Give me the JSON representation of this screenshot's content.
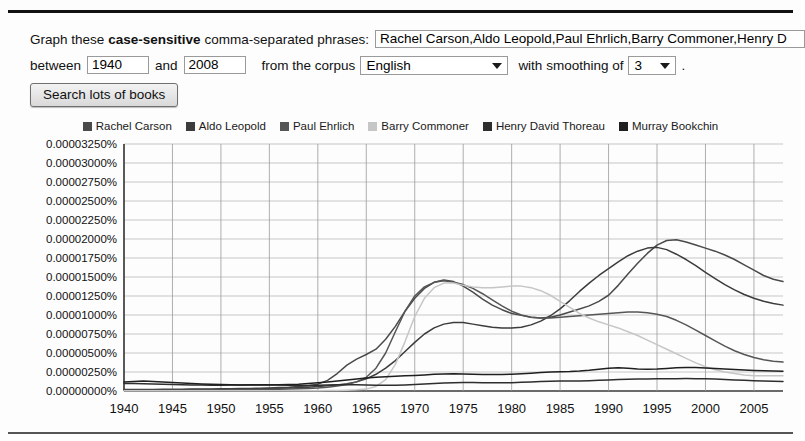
{
  "form": {
    "label_prefix": "Graph these",
    "label_emphasis": "case-sensitive",
    "label_suffix": "comma-separated phrases:",
    "phrases_value": "Rachel Carson,Aldo Leopold,Paul Ehrlich,Barry Commoner,Henry D",
    "phrases_placeholder": "comma-separated phrases",
    "between_label": "between",
    "start_year": "1940",
    "and_label": "and",
    "end_year": "2008",
    "corpus_label": "from the corpus",
    "corpus_value": "English",
    "corpus_options": [
      "English"
    ],
    "smoothing_label": "with smoothing of",
    "smoothing_value": "3",
    "smoothing_options": [
      "3"
    ],
    "trailing_period": ".",
    "search_button": "Search lots of books"
  },
  "chart_data": {
    "type": "line",
    "title": "",
    "xlabel": "",
    "ylabel": "",
    "xlim": [
      1940,
      2008
    ],
    "ylim": [
      0.0,
      3.25e-05
    ],
    "grid": true,
    "legend_position": "top",
    "x_ticks": [
      1940,
      1945,
      1950,
      1955,
      1960,
      1965,
      1970,
      1975,
      1980,
      1985,
      1990,
      1995,
      2000,
      2005
    ],
    "y_ticks": [
      0.0,
      2.5e-06,
      5e-06,
      7.5e-06,
      1e-05,
      1.25e-05,
      1.5e-05,
      1.75e-05,
      2e-05,
      2.25e-05,
      2.5e-05,
      2.75e-05,
      3e-05,
      3.25e-05
    ],
    "y_tick_labels": [
      "0.00000000%",
      "0.00000250%",
      "0.00000500%",
      "0.00000750%",
      "0.00001000%",
      "0.00001250%",
      "0.00001500%",
      "0.00001750%",
      "0.00002000%",
      "0.00002250%",
      "0.00002500%",
      "0.00002750%",
      "0.00003000%",
      "0.00003250%"
    ],
    "x": [
      1940,
      1941,
      1942,
      1943,
      1944,
      1945,
      1946,
      1947,
      1948,
      1949,
      1950,
      1951,
      1952,
      1953,
      1954,
      1955,
      1956,
      1957,
      1958,
      1959,
      1960,
      1961,
      1962,
      1963,
      1964,
      1965,
      1966,
      1967,
      1968,
      1969,
      1970,
      1971,
      1972,
      1973,
      1974,
      1975,
      1976,
      1977,
      1978,
      1979,
      1980,
      1981,
      1982,
      1983,
      1984,
      1985,
      1986,
      1987,
      1988,
      1989,
      1990,
      1991,
      1992,
      1993,
      1994,
      1995,
      1996,
      1997,
      1998,
      1999,
      2000,
      2001,
      2002,
      2003,
      2004,
      2005,
      2006,
      2007,
      2008
    ],
    "series": [
      {
        "name": "Rachel Carson",
        "color": "#4a4a4a",
        "values": [
          2e-07,
          2e-07,
          2e-07,
          2e-07,
          2.2e-07,
          2.2e-07,
          2.4e-07,
          2.5e-07,
          2.6e-07,
          2.7e-07,
          2.8e-07,
          3e-07,
          3.2e-07,
          3.4e-07,
          3.7e-07,
          4e-07,
          4.5e-07,
          5e-07,
          5.8e-07,
          7e-07,
          9e-07,
          1.4e-06,
          2.3e-06,
          3.4e-06,
          4.2e-06,
          4.8e-06,
          5.5e-06,
          6.8e-06,
          8.5e-06,
          1.05e-05,
          1.22e-05,
          1.35e-05,
          1.43e-05,
          1.46e-05,
          1.44e-05,
          1.38e-05,
          1.3e-05,
          1.21e-05,
          1.13e-05,
          1.07e-05,
          1.02e-05,
          9.95e-06,
          9.7e-06,
          9.6e-06,
          9.7e-06,
          1e-05,
          1.04e-05,
          1.08e-05,
          1.12e-05,
          1.18e-05,
          1.26e-05,
          1.39e-05,
          1.54e-05,
          1.68e-05,
          1.81e-05,
          1.92e-05,
          1.98e-05,
          1.99e-05,
          1.96e-05,
          1.92e-05,
          1.88e-05,
          1.84e-05,
          1.79e-05,
          1.73e-05,
          1.66e-05,
          1.59e-05,
          1.52e-05,
          1.47e-05,
          1.44e-05
        ]
      },
      {
        "name": "Aldo Leopold",
        "color": "#3c3c3c",
        "values": [
          1.5e-07,
          1.5e-07,
          1.5e-07,
          1.6e-07,
          1.6e-07,
          1.7e-07,
          1.8e-07,
          1.9e-07,
          2e-07,
          2.1e-07,
          2.2e-07,
          2.3e-07,
          2.5e-07,
          2.7e-07,
          2.9e-07,
          3.2e-07,
          3.5e-07,
          3.9e-07,
          4.4e-07,
          5e-07,
          5.8e-07,
          6.8e-07,
          8e-07,
          9.5e-07,
          1.2e-06,
          1.6e-06,
          2.2e-06,
          3e-06,
          4e-06,
          5.2e-06,
          6.4e-06,
          7.5e-06,
          8.3e-06,
          8.8e-06,
          9e-06,
          9e-06,
          8.8e-06,
          8.6e-06,
          8.4e-06,
          8.3e-06,
          8.3e-06,
          8.4e-06,
          8.7e-06,
          9.2e-06,
          9.9e-06,
          1.08e-05,
          1.19e-05,
          1.31e-05,
          1.42e-05,
          1.52e-05,
          1.61e-05,
          1.7e-05,
          1.78e-05,
          1.84e-05,
          1.88e-05,
          1.89e-05,
          1.86e-05,
          1.8e-05,
          1.73e-05,
          1.65e-05,
          1.56e-05,
          1.48e-05,
          1.4e-05,
          1.33e-05,
          1.27e-05,
          1.22e-05,
          1.18e-05,
          1.15e-05,
          1.13e-05
        ]
      },
      {
        "name": "Paul Ehrlich",
        "color": "#565656",
        "values": [
          1e-07,
          1e-07,
          1e-07,
          1e-07,
          1e-07,
          1.1e-07,
          1.1e-07,
          1.2e-07,
          1.2e-07,
          1.3e-07,
          1.4e-07,
          1.5e-07,
          1.6e-07,
          1.7e-07,
          1.9e-07,
          2e-07,
          2.2e-07,
          2.5e-07,
          2.8e-07,
          3.3e-07,
          4e-07,
          5e-07,
          6.5e-07,
          8.5e-07,
          1.2e-06,
          1.8e-06,
          3e-06,
          5e-06,
          7.8e-06,
          1.05e-05,
          1.25e-05,
          1.37e-05,
          1.43e-05,
          1.45e-05,
          1.43e-05,
          1.4e-05,
          1.35e-05,
          1.28e-05,
          1.2e-05,
          1.12e-05,
          1.05e-05,
          1e-05,
          9.7e-06,
          9.6e-06,
          9.6e-06,
          9.7e-06,
          9.8e-06,
          9.9e-06,
          1e-05,
          1.01e-05,
          1.02e-05,
          1.03e-05,
          1.04e-05,
          1.04e-05,
          1.03e-05,
          1.01e-05,
          9.8e-06,
          9.3e-06,
          8.7e-06,
          8e-06,
          7.3e-06,
          6.6e-06,
          5.9e-06,
          5.3e-06,
          4.8e-06,
          4.4e-06,
          4.1e-06,
          3.9e-06,
          3.8e-06
        ]
      },
      {
        "name": "Barry Commoner",
        "color": "#c6c6c6",
        "values": [
          2e-08,
          2e-08,
          2e-08,
          2e-08,
          2e-08,
          2e-08,
          2e-08,
          2e-08,
          2e-08,
          2e-08,
          2e-08,
          2e-08,
          2e-08,
          2e-08,
          2e-08,
          2e-08,
          2e-08,
          2e-08,
          3e-08,
          3e-08,
          4e-08,
          5e-08,
          7e-08,
          1e-07,
          1.5e-07,
          2.5e-07,
          6e-07,
          1.5e-06,
          3.5e-06,
          6.5e-06,
          9.8e-06,
          1.22e-05,
          1.36e-05,
          1.42e-05,
          1.42e-05,
          1.39e-05,
          1.37e-05,
          1.36e-05,
          1.36e-05,
          1.37e-05,
          1.38e-05,
          1.38e-05,
          1.36e-05,
          1.32e-05,
          1.26e-05,
          1.18e-05,
          1.1e-05,
          1.02e-05,
          9.6e-06,
          9.1e-06,
          8.7e-06,
          8.3e-06,
          7.8e-06,
          7.3e-06,
          6.7e-06,
          6.1e-06,
          5.5e-06,
          4.9e-06,
          4.3e-06,
          3.7e-06,
          3.2e-06,
          2.8e-06,
          2.5e-06,
          2.3e-06,
          2.1e-06,
          2e-06,
          2e-06,
          2e-06,
          2e-06
        ]
      },
      {
        "name": "Henry David Thoreau",
        "color": "#2e2e2e",
        "values": [
          1e-06,
          9.8e-07,
          9.5e-07,
          9.2e-07,
          8.8e-07,
          8.5e-07,
          8.2e-07,
          8e-07,
          7.8e-07,
          7.7e-07,
          7.7e-07,
          7.8e-07,
          8e-07,
          8.2e-07,
          8.3e-07,
          8.2e-07,
          8e-07,
          7.6e-07,
          7.2e-07,
          7.3e-07,
          7.6e-07,
          8e-07,
          8.2e-07,
          8.3e-07,
          8.2e-07,
          7.9e-07,
          7.6e-07,
          7.5e-07,
          7.6e-07,
          8e-07,
          8.6e-07,
          9.3e-07,
          1e-06,
          1.06e-06,
          1.1e-06,
          1.12e-06,
          1.11e-06,
          1.09e-06,
          1.08e-06,
          1.08e-06,
          1.1e-06,
          1.14e-06,
          1.2e-06,
          1.25e-06,
          1.28e-06,
          1.3e-06,
          1.31e-06,
          1.33e-06,
          1.36e-06,
          1.4e-06,
          1.45e-06,
          1.5e-06,
          1.54e-06,
          1.57e-06,
          1.59e-06,
          1.6e-06,
          1.61e-06,
          1.62e-06,
          1.63e-06,
          1.62e-06,
          1.6e-06,
          1.57e-06,
          1.52e-06,
          1.46e-06,
          1.4e-06,
          1.35e-06,
          1.31e-06,
          1.28e-06,
          1.26e-06
        ]
      },
      {
        "name": "Murray Bookchin",
        "color": "#1f1f1f",
        "values": [
          1.2e-06,
          1.25e-06,
          1.3e-06,
          1.25e-06,
          1.2e-06,
          1.12e-06,
          1.05e-06,
          9.8e-07,
          9.2e-07,
          8.8e-07,
          8.5e-07,
          8.2e-07,
          8e-07,
          7.9e-07,
          7.9e-07,
          8e-07,
          8.2e-07,
          8.5e-07,
          9e-07,
          9.8e-07,
          1.08e-06,
          1.2e-06,
          1.32e-06,
          1.45e-06,
          1.58e-06,
          1.7e-06,
          1.8e-06,
          1.88e-06,
          1.95e-06,
          2e-06,
          2.05e-06,
          2.12e-06,
          2.2e-06,
          2.25e-06,
          2.26e-06,
          2.24e-06,
          2.2e-06,
          2.17e-06,
          2.16e-06,
          2.17e-06,
          2.2e-06,
          2.26e-06,
          2.34e-06,
          2.43e-06,
          2.5e-06,
          2.54e-06,
          2.56e-06,
          2.62e-06,
          2.72e-06,
          2.85e-06,
          3e-06,
          3.05e-06,
          2.98e-06,
          2.9e-06,
          2.85e-06,
          2.88e-06,
          2.96e-06,
          3.05e-06,
          3.1e-06,
          3.08e-06,
          3.02e-06,
          2.95e-06,
          2.88e-06,
          2.82e-06,
          2.76e-06,
          2.7e-06,
          2.65e-06,
          2.62e-06,
          2.6e-06
        ]
      }
    ]
  }
}
